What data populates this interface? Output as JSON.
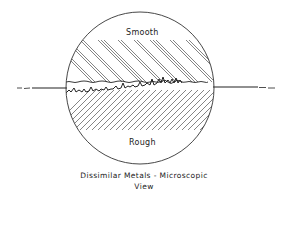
{
  "diagram": {
    "title": "Dissimilar Metals - Microscopic View",
    "caption_line1": "Dissimilar  Metals - Microscopic",
    "caption_line2": "View",
    "labels": {
      "top_region": "Smooth",
      "bottom_region": "Rough"
    },
    "colors": {
      "ink": "#222222",
      "background": "#ffffff"
    },
    "elements": [
      {
        "name": "magnified-circle",
        "type": "circle"
      },
      {
        "name": "smooth-metal-surface",
        "type": "hatched-region",
        "hatch": "back-slash"
      },
      {
        "name": "rough-metal-surface",
        "type": "hatched-region",
        "hatch": "forward-slash"
      },
      {
        "name": "contact-interface-line",
        "type": "horizontal-line"
      }
    ]
  }
}
